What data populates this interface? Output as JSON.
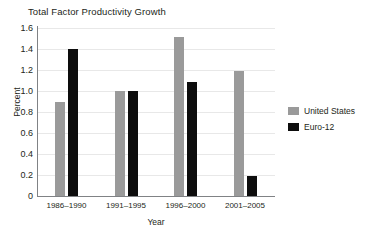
{
  "chart_data": {
    "type": "bar",
    "title": "Total Factor Productivity Growth",
    "xlabel": "Year",
    "ylabel": "Percent",
    "categories": [
      "1986–1990",
      "1991–1995",
      "1996–2000",
      "2001–2005"
    ],
    "series": [
      {
        "name": "United States",
        "color": "#9a9a9a",
        "values": [
          0.9,
          1.0,
          1.51,
          1.19
        ]
      },
      {
        "name": "Euro-12",
        "color": "#0d0d0d",
        "values": [
          1.4,
          1.0,
          1.09,
          0.19
        ]
      }
    ],
    "ylim": [
      0,
      1.6
    ],
    "yticks": [
      "0",
      "0.2",
      "0.4",
      "0.6",
      "0.8",
      "1.0",
      "1.2",
      "1.4",
      "1.6"
    ],
    "ytick_values": [
      0,
      0.2,
      0.4,
      0.6,
      0.8,
      1.0,
      1.2,
      1.4,
      1.6
    ],
    "grid": true,
    "legend_position": "right"
  }
}
